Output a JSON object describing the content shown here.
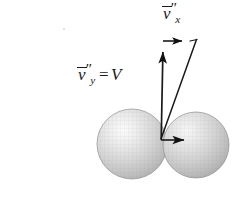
{
  "figure": {
    "background_color": "#ffffff",
    "width": 237,
    "height": 201,
    "ink_color": "#1a1a1a"
  },
  "labels": {
    "vx": {
      "symbol": "v",
      "accent": "vector-overbar",
      "primes": "″",
      "subscript": "x",
      "full_text": "v̅″x"
    },
    "vy": {
      "symbol": "v",
      "accent": "vector-overbar",
      "primes": "″",
      "subscript": "y",
      "equals": "=",
      "value": "V",
      "full_text": "v̅″y = V"
    }
  },
  "spheres": [
    {
      "name": "left-sphere",
      "cx": 132,
      "cy": 144,
      "r": 35,
      "highlight_x": 124,
      "highlight_y": 134,
      "fill_light": "#f2f2f2",
      "fill_mid": "#cfcfcf",
      "fill_dark": "#9a9a9a",
      "edge": "#8c8c8c"
    },
    {
      "name": "right-sphere",
      "cx": 196,
      "cy": 145,
      "r": 33,
      "highlight_x": 188,
      "highlight_y": 134,
      "fill_light": "#f0f0f0",
      "fill_mid": "#cbcbcb",
      "fill_dark": "#979797",
      "edge": "#8c8c8c"
    }
  ],
  "vectors": [
    {
      "name": "vy-vertical-arrow",
      "label_ref": "vy",
      "x1": 161,
      "y1": 139,
      "x2": 163,
      "y2": 43,
      "has_arrowhead": true,
      "stroke": "#1a1a1a",
      "stroke_width": 1.6
    },
    {
      "name": "vx-horizontal-arrow-top",
      "label_ref": "vx",
      "x1": 163,
      "y1": 41,
      "x2": 191,
      "y2": 41,
      "has_arrowhead": true,
      "stroke": "#1a1a1a",
      "stroke_width": 1.6
    },
    {
      "name": "vx-horizontal-arrow-bottom",
      "label_ref": "vx",
      "x1": 161,
      "y1": 140,
      "x2": 194,
      "y2": 140,
      "has_arrowhead": true,
      "stroke": "#1a1a1a",
      "stroke_width": 1.6
    },
    {
      "name": "resultant-diagonal",
      "label_ref": null,
      "x1": 161,
      "y1": 139,
      "x2": 196,
      "y2": 40,
      "has_arrowhead": false,
      "stroke": "#1a1a1a",
      "stroke_width": 1.4
    },
    {
      "name": "parallelogram-top-edge",
      "x1": 191,
      "y1": 41,
      "x2": 197,
      "y2": 40,
      "stroke": "#1a1a1a",
      "stroke_width": 1.2
    }
  ],
  "artifacts": [
    {
      "name": "speck",
      "x": 63,
      "y": 28
    }
  ]
}
